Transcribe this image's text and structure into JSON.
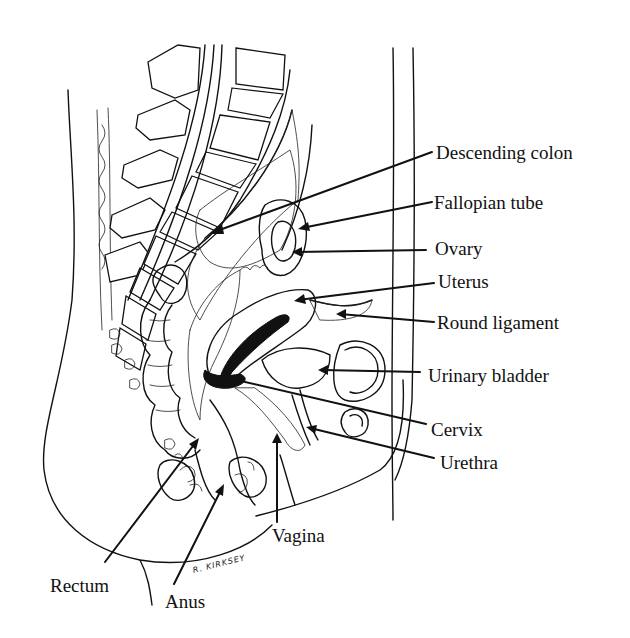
{
  "diagram": {
    "signature": "R. KIRKSEY",
    "colors": {
      "background": "#ffffff",
      "ink": "#111111"
    },
    "labels": {
      "descending_colon": "Descending colon",
      "fallopian_tube": "Fallopian tube",
      "ovary": "Ovary",
      "uterus": "Uterus",
      "round_ligament": "Round ligament",
      "urinary_bladder": "Urinary bladder",
      "cervix": "Cervix",
      "urethra": "Urethra",
      "vagina": "Vagina",
      "rectum": "Rectum",
      "anus": "Anus"
    }
  }
}
